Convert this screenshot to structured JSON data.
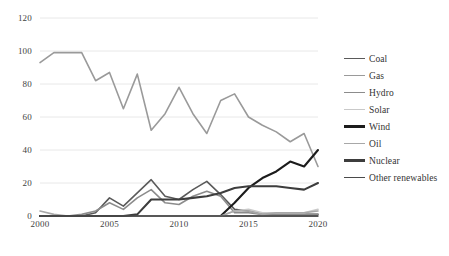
{
  "chart_data": {
    "type": "line",
    "title": "",
    "xlabel": "",
    "ylabel": "",
    "xlim": [
      2000,
      2020
    ],
    "ylim": [
      0,
      120
    ],
    "yticks": [
      0,
      20,
      40,
      60,
      80,
      100,
      120
    ],
    "xticks": [
      2000,
      2005,
      2010,
      2015,
      2020
    ],
    "grid": true,
    "legend_position": "right",
    "x": [
      2000,
      2001,
      2002,
      2003,
      2004,
      2005,
      2006,
      2007,
      2008,
      2009,
      2010,
      2011,
      2012,
      2013,
      2014,
      2015,
      2016,
      2017,
      2018,
      2019,
      2020
    ],
    "series": [
      {
        "name": "Coal",
        "color": "#5a5a5a",
        "width": 1.6,
        "values": [
          0,
          0,
          0,
          0,
          2,
          11,
          6,
          14,
          22,
          12,
          10,
          16,
          21,
          13,
          4,
          3,
          1,
          1,
          1,
          1,
          1
        ]
      },
      {
        "name": "Gas",
        "color": "#9a9a9a",
        "width": 1.6,
        "values": [
          93,
          99,
          99,
          99,
          82,
          87,
          65,
          86,
          52,
          62,
          78,
          62,
          50,
          70,
          74,
          60,
          55,
          51,
          45,
          50,
          30
        ]
      },
      {
        "name": "Hydro",
        "color": "#8c8c8c",
        "width": 1.6,
        "values": [
          0,
          0,
          0,
          1,
          3,
          8,
          4,
          11,
          16,
          8,
          7,
          12,
          15,
          12,
          2,
          2,
          1,
          1,
          1,
          1,
          1
        ]
      },
      {
        "name": "Solar",
        "color": "#c9c9c9",
        "width": 1.6,
        "values": [
          0,
          0,
          0,
          0,
          0,
          0,
          0,
          0,
          0,
          0,
          0,
          0,
          0,
          0,
          3,
          4,
          2,
          2,
          2,
          2,
          4
        ]
      },
      {
        "name": "Wind",
        "color": "#1c1c1c",
        "width": 2.1,
        "values": [
          0,
          0,
          0,
          0,
          0,
          0,
          0,
          0,
          0,
          0,
          0,
          0,
          0,
          0,
          8,
          17,
          23,
          27,
          33,
          30,
          40
        ]
      },
      {
        "name": "Oil",
        "color": "#a8a8a8",
        "width": 1.6,
        "values": [
          3,
          1,
          0,
          0,
          0,
          0,
          0,
          0,
          0,
          0,
          0,
          0,
          0,
          0,
          3,
          3,
          1,
          2,
          2,
          2,
          3
        ]
      },
      {
        "name": "Nuclear",
        "color": "#3d3d3d",
        "width": 2.1,
        "values": [
          0,
          0,
          0,
          0,
          0,
          0,
          0,
          1,
          10,
          10,
          10,
          11,
          12,
          14,
          17,
          18,
          18,
          18,
          17,
          16,
          20
        ]
      },
      {
        "name": "Other renewables",
        "color": "#4a4a4a",
        "width": 1.6,
        "values": [
          0,
          0,
          0,
          0,
          0,
          0,
          0,
          0,
          0,
          0,
          0,
          0,
          0,
          0,
          0,
          0,
          0,
          0,
          0,
          0,
          0
        ]
      }
    ]
  },
  "legend": {
    "items": [
      {
        "label": "Coal"
      },
      {
        "label": "Gas"
      },
      {
        "label": "Hydro"
      },
      {
        "label": "Solar"
      },
      {
        "label": "Wind"
      },
      {
        "label": "Oil"
      },
      {
        "label": "Nuclear"
      },
      {
        "label": "Other renewables"
      }
    ]
  }
}
